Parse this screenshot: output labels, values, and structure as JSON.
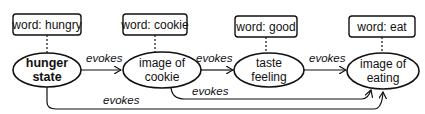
{
  "diagram": {
    "nodes": [
      {
        "id": "hunger",
        "line1": "hunger",
        "line2": "state",
        "bold": true,
        "word": "word: hungry"
      },
      {
        "id": "cookie",
        "line1": "image of",
        "line2": "cookie",
        "bold": false,
        "word": "word: cookie"
      },
      {
        "id": "taste",
        "line1": "taste",
        "line2": "feeling",
        "bold": false,
        "word": "word: good"
      },
      {
        "id": "eating",
        "line1": "image of",
        "line2": "eating",
        "bold": false,
        "word": "word: eat"
      }
    ],
    "edges": [
      {
        "from": "hunger",
        "to": "cookie",
        "label": "evokes"
      },
      {
        "from": "cookie",
        "to": "taste",
        "label": "evokes"
      },
      {
        "from": "taste",
        "to": "eating",
        "label": "evokes"
      },
      {
        "from": "cookie",
        "to": "eating",
        "label": "evokes"
      },
      {
        "from": "hunger",
        "to": "eating",
        "label": "evokes"
      }
    ]
  }
}
